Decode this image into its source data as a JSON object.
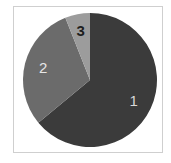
{
  "chart_data": {
    "type": "pie",
    "title": "",
    "categories": [
      "1",
      "2",
      "3"
    ],
    "values": [
      64,
      30,
      6
    ],
    "colors": [
      "#3b3b3b",
      "#6b6b6b",
      "#9c9c9c"
    ],
    "label_colors": [
      "#d8d8d8",
      "#e6e6e6",
      "#1e1e1e"
    ],
    "start_angle_deg": 0,
    "direction": "clockwise",
    "legend": "none",
    "labels_inside": true
  }
}
